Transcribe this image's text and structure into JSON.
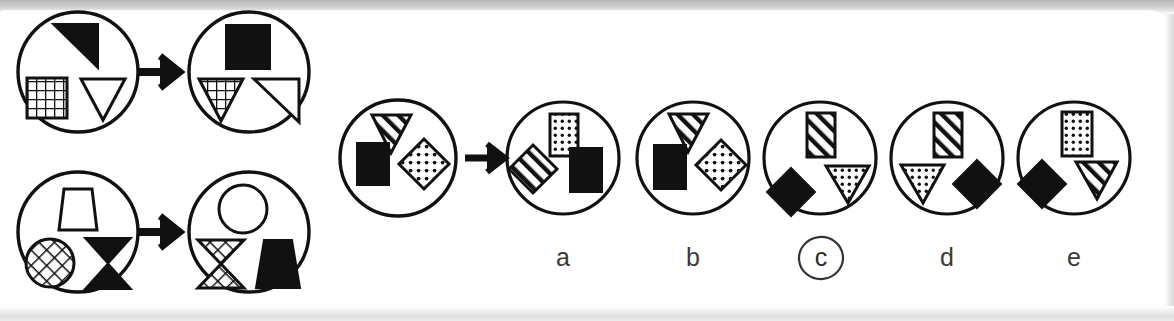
{
  "puzzle": {
    "type": "visual-analogy-matrix-reasoning",
    "title": "Figural analogy multiple choice item",
    "transformation_rule": "Top shape and bottom-right shape swap position; fills are retained by shape",
    "marked_answer": "c"
  },
  "examples": [
    {
      "name": "example-1",
      "source": {
        "name": "example-1-source",
        "shapes": [
          {
            "slot": "top",
            "shape": "right-triangle",
            "fill": "solid-black"
          },
          {
            "slot": "bottom-left",
            "shape": "square",
            "fill": "grid"
          },
          {
            "slot": "bottom-right",
            "shape": "down-triangle",
            "fill": "outline"
          }
        ]
      },
      "result": {
        "name": "example-1-result",
        "shapes": [
          {
            "slot": "top",
            "shape": "square",
            "fill": "solid-black"
          },
          {
            "slot": "bottom-left",
            "shape": "down-triangle",
            "fill": "grid"
          },
          {
            "slot": "bottom-right",
            "shape": "right-triangle",
            "fill": "outline"
          }
        ]
      }
    },
    {
      "name": "example-2",
      "source": {
        "name": "example-2-source",
        "shapes": [
          {
            "slot": "top",
            "shape": "trapezoid",
            "fill": "outline"
          },
          {
            "slot": "bottom-left",
            "shape": "circle",
            "fill": "crosshatch"
          },
          {
            "slot": "bottom-right",
            "shape": "bowtie",
            "fill": "solid-black"
          }
        ]
      },
      "result": {
        "name": "example-2-result",
        "shapes": [
          {
            "slot": "top",
            "shape": "circle",
            "fill": "outline"
          },
          {
            "slot": "bottom-left",
            "shape": "bowtie",
            "fill": "crosshatch"
          },
          {
            "slot": "bottom-right",
            "shape": "trapezoid",
            "fill": "solid-black"
          }
        ]
      }
    }
  ],
  "question": {
    "name": "question-stem",
    "shapes": [
      {
        "slot": "top",
        "shape": "down-triangle",
        "fill": "diagonal-stripes"
      },
      {
        "slot": "bottom-left",
        "shape": "rectangle",
        "fill": "solid-black"
      },
      {
        "slot": "bottom-right",
        "shape": "diamond",
        "fill": "dots"
      }
    ]
  },
  "options": [
    {
      "label": "a",
      "marked": false,
      "shapes": [
        {
          "slot": "top",
          "shape": "rectangle",
          "fill": "dots"
        },
        {
          "slot": "bottom-left",
          "shape": "diamond",
          "fill": "diagonal-stripes"
        },
        {
          "slot": "bottom-right",
          "shape": "rectangle",
          "fill": "solid-black"
        }
      ]
    },
    {
      "label": "b",
      "marked": false,
      "shapes": [
        {
          "slot": "top",
          "shape": "down-triangle",
          "fill": "diagonal-stripes"
        },
        {
          "slot": "bottom-left",
          "shape": "rectangle",
          "fill": "solid-black"
        },
        {
          "slot": "bottom-right",
          "shape": "diamond",
          "fill": "dots"
        }
      ]
    },
    {
      "label": "c",
      "marked": true,
      "shapes": [
        {
          "slot": "top",
          "shape": "rectangle",
          "fill": "diagonal-stripes"
        },
        {
          "slot": "bottom-left",
          "shape": "diamond",
          "fill": "solid-black"
        },
        {
          "slot": "bottom-right",
          "shape": "down-triangle",
          "fill": "dots"
        }
      ]
    },
    {
      "label": "d",
      "marked": false,
      "shapes": [
        {
          "slot": "top",
          "shape": "rectangle",
          "fill": "diagonal-stripes"
        },
        {
          "slot": "bottom-left",
          "shape": "down-triangle",
          "fill": "dots"
        },
        {
          "slot": "bottom-right",
          "shape": "diamond",
          "fill": "solid-black"
        }
      ]
    },
    {
      "label": "e",
      "marked": false,
      "shapes": [
        {
          "slot": "top",
          "shape": "rectangle",
          "fill": "dots"
        },
        {
          "slot": "bottom-left",
          "shape": "diamond",
          "fill": "solid-black"
        },
        {
          "slot": "bottom-right",
          "shape": "down-triangle",
          "fill": "diagonal-stripes"
        }
      ]
    }
  ],
  "colors": {
    "ink": "#111111",
    "paper": "#ffffff",
    "label_text": "#3a3a3a",
    "scan_edge": "#c9c9c9"
  },
  "geometry": {
    "examples": [
      {
        "source_cx": 78,
        "source_cy": 72,
        "r": 60,
        "arrow_x": 148,
        "arrow_y": 72,
        "result_cx": 249,
        "result_cy": 72
      },
      {
        "source_cx": 78,
        "source_cy": 232,
        "r": 60,
        "arrow_x": 148,
        "arrow_y": 232,
        "result_cx": 249,
        "result_cy": 232
      }
    ],
    "question": {
      "cx": 398,
      "cy": 158,
      "r": 58
    },
    "arrow_question": {
      "x": 478,
      "y": 158
    },
    "options": [
      {
        "cx": 563,
        "cy": 158,
        "r": 56,
        "label_x": 563,
        "label_y": 252
      },
      {
        "cx": 693,
        "cy": 158,
        "r": 56,
        "label_x": 693,
        "label_y": 252
      },
      {
        "cx": 820,
        "cy": 158,
        "r": 56,
        "label_x": 820,
        "label_y": 252
      },
      {
        "cx": 947,
        "cy": 158,
        "r": 56,
        "label_x": 947,
        "label_y": 252
      },
      {
        "cx": 1074,
        "cy": 158,
        "r": 56,
        "label_x": 1074,
        "label_y": 252
      }
    ]
  }
}
